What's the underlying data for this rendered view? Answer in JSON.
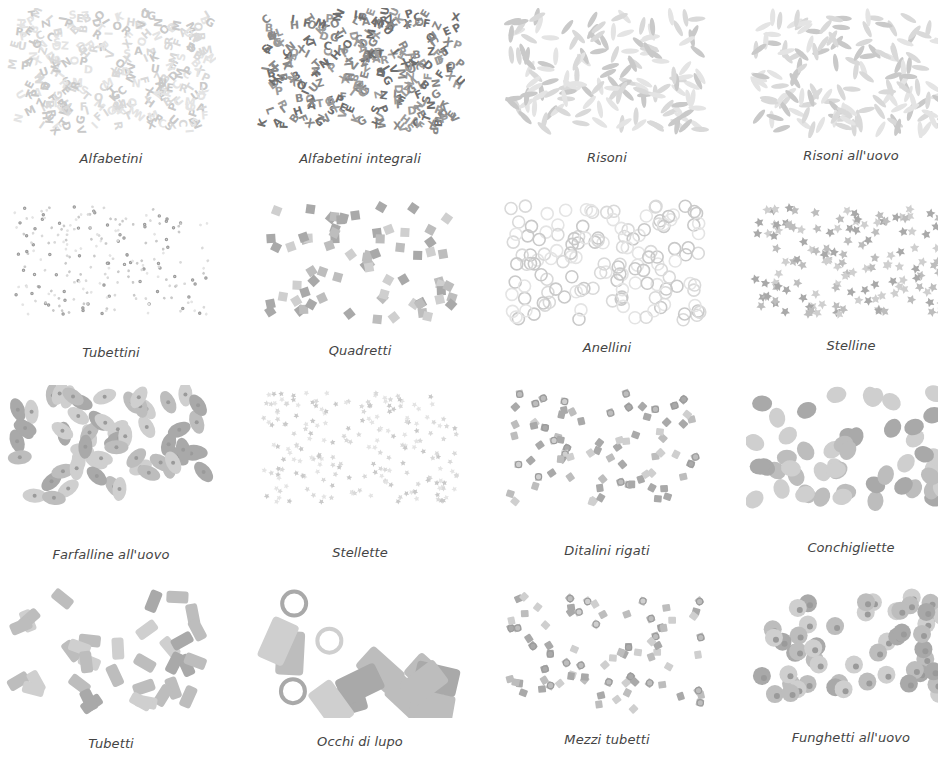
{
  "rows": [
    {
      "items": [
        {
          "name": "Alfabetini",
          "shape": "letters",
          "tone": "light"
        },
        {
          "name": "Alfabetini integrali",
          "shape": "letters",
          "tone": "dark"
        },
        {
          "name": "Risoni",
          "shape": "grains",
          "tone": "light"
        },
        {
          "name": "Risoni all'uovo",
          "shape": "grains",
          "tone": "light"
        }
      ]
    },
    {
      "items": [
        {
          "name": "Tubettini",
          "shape": "tiny-tubes",
          "tone": "light"
        },
        {
          "name": "Quadretti",
          "shape": "squares",
          "tone": "mid"
        },
        {
          "name": "Anellini",
          "shape": "rings",
          "tone": "light"
        },
        {
          "name": "Stelline",
          "shape": "stars",
          "tone": "mid"
        }
      ]
    },
    {
      "items": [
        {
          "name": "Farfalline all'uovo",
          "shape": "bowties",
          "tone": "mid"
        },
        {
          "name": "Stellette",
          "shape": "small-stars",
          "tone": "light"
        },
        {
          "name": "Ditalini rigati",
          "shape": "short-tubes",
          "tone": "mid"
        },
        {
          "name": "Conchigliette",
          "shape": "shells",
          "tone": "mid"
        }
      ]
    },
    {
      "items": [
        {
          "name": "Tubetti",
          "shape": "tubes",
          "tone": "mid"
        },
        {
          "name": "Occhi di lupo",
          "shape": "large-tubes",
          "tone": "mid"
        },
        {
          "name": "Mezzi tubetti",
          "shape": "short-tubes",
          "tone": "mid"
        },
        {
          "name": "Funghetti all'uovo",
          "shape": "mushrooms",
          "tone": "mid"
        }
      ]
    }
  ]
}
